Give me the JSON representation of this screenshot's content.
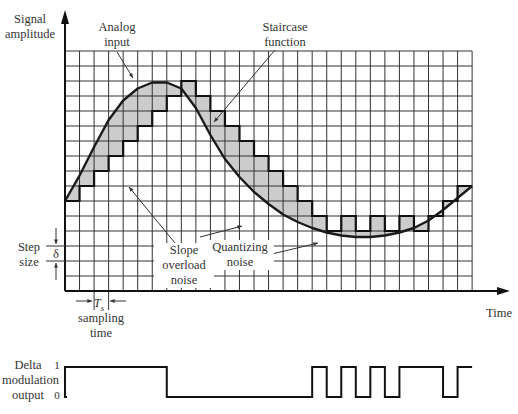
{
  "labels": {
    "y_axis": [
      "Signal",
      "amplitude"
    ],
    "x_axis": "Time",
    "analog_input": [
      "Analog",
      "input"
    ],
    "staircase": [
      "Staircase",
      "function"
    ],
    "slope_overload": [
      "Slope",
      "overload",
      "noise"
    ],
    "quantizing": [
      "Quantizing",
      "noise"
    ],
    "step_size": [
      "Step",
      "size"
    ],
    "delta_symbol": "δ",
    "ts_symbol": "T",
    "ts_sub": "s",
    "sampling_time": [
      "sampling",
      "time"
    ],
    "output_label": [
      "Delta",
      "modulation",
      "output"
    ],
    "level_one": "1",
    "level_zero": "0"
  },
  "grid": {
    "x0": 65,
    "y0": 51,
    "cols": 28,
    "rows": 16,
    "cell_w": 14.54,
    "cell_h": 15
  },
  "staircase_levels": [
    10,
    9,
    8,
    7,
    6,
    5,
    4,
    3,
    2,
    3,
    4,
    5,
    6,
    7,
    8,
    9,
    10,
    11,
    12,
    11,
    12,
    11,
    12,
    11,
    12,
    11,
    10,
    9,
    10
  ],
  "output_bits": [
    1,
    1,
    1,
    1,
    1,
    1,
    1,
    0,
    0,
    0,
    0,
    0,
    0,
    0,
    0,
    0,
    0,
    1,
    0,
    1,
    0,
    1,
    0,
    1,
    1,
    1,
    0,
    1
  ],
  "colors": {
    "grid": "#333333",
    "fill": "#cccccc",
    "curve": "#1a1a1a"
  }
}
